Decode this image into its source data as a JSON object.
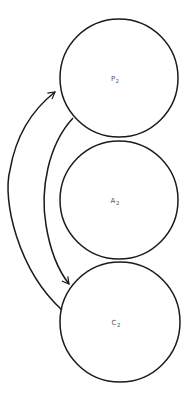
{
  "diagram": {
    "type": "cycle-diagram",
    "stroke_color": "#1a1a1a",
    "label_color": "#555555",
    "background": "#ffffff",
    "nodes": [
      {
        "id": "P2",
        "letter": "P",
        "subscript": "2",
        "cx": 119,
        "cy": 78,
        "r": 59
      },
      {
        "id": "A2",
        "letter": "A",
        "subscript": "2",
        "cx": 119,
        "cy": 200,
        "r": 59
      },
      {
        "id": "C2",
        "letter": "C",
        "subscript": "2",
        "cx": 120,
        "cy": 322,
        "r": 60
      }
    ],
    "edges": [
      {
        "from": "C2",
        "to": "P2",
        "direction": "up",
        "side": "outer-left"
      },
      {
        "from": "P2",
        "to": "C2",
        "direction": "down",
        "side": "inner-left"
      }
    ]
  }
}
